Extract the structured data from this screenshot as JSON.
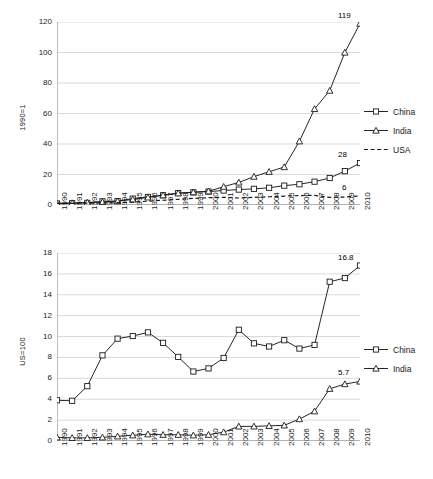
{
  "chart_data": [
    {
      "id": "top",
      "type": "line",
      "title": "",
      "xlabel": "",
      "ylabel": "1990=1",
      "ylim": [
        0,
        120
      ],
      "yticks": [
        0,
        20,
        40,
        60,
        80,
        100,
        120
      ],
      "grid": true,
      "legend_position": "right",
      "x": [
        1990,
        1991,
        1992,
        1993,
        1994,
        1995,
        1996,
        1997,
        1998,
        1999,
        2000,
        2001,
        2002,
        2003,
        2004,
        2005,
        2006,
        2007,
        2008,
        2009,
        2010
      ],
      "categories": [
        "1990",
        "1991",
        "1992",
        "1993",
        "1994",
        "1995",
        "1996",
        "1997",
        "1998",
        "1999",
        "2000",
        "2001",
        "2002",
        "2003",
        "2004",
        "2005",
        "2006",
        "2007",
        "2008",
        "2009",
        "2010"
      ],
      "series": [
        {
          "name": "China",
          "marker": "square",
          "line": "solid",
          "values": [
            1,
            1.2,
            1.4,
            2.4,
            2.6,
            4.2,
            5.3,
            6.4,
            7.8,
            8.3,
            8.8,
            9.5,
            10.1,
            10.6,
            11.3,
            12.7,
            13.6,
            15.3,
            17.7,
            22.2,
            27.5
          ],
          "end_label": "28"
        },
        {
          "name": "India",
          "marker": "triangle",
          "line": "solid",
          "values": [
            1,
            1.3,
            1.6,
            2.0,
            2.5,
            3.6,
            5.0,
            6.4,
            7.7,
            8.4,
            9.0,
            12.0,
            14.8,
            18.6,
            21.8,
            24.9,
            41.8,
            63.0,
            75.0,
            100.0,
            119.0
          ],
          "end_label": "119"
        },
        {
          "name": "USA",
          "marker": "none",
          "line": "dashed",
          "values": [
            1,
            1.1,
            1.2,
            1.3,
            1.5,
            1.9,
            2.5,
            3.1,
            3.7,
            4.3,
            4.8,
            5.0,
            4.6,
            5.0,
            5.4,
            5.8,
            6.2,
            6.3,
            5.0,
            5.2,
            6.0
          ],
          "end_label": "6"
        }
      ]
    },
    {
      "id": "bottom",
      "type": "line",
      "title": "",
      "xlabel": "",
      "ylabel": "US=100",
      "ylim": [
        0,
        18
      ],
      "yticks": [
        0,
        2,
        4,
        6,
        8,
        10,
        12,
        14,
        16,
        18
      ],
      "grid": true,
      "legend_position": "right",
      "x": [
        1990,
        1991,
        1992,
        1993,
        1994,
        1995,
        1996,
        1997,
        1998,
        1999,
        2000,
        2001,
        2002,
        2003,
        2004,
        2005,
        2006,
        2007,
        2008,
        2009,
        2010
      ],
      "categories": [
        "1990",
        "1991",
        "1992",
        "1993",
        "1994",
        "1995",
        "1996",
        "1997",
        "1998",
        "1999",
        "2000",
        "2001",
        "2002",
        "2003",
        "2004",
        "2005",
        "2006",
        "2007",
        "2008",
        "2009",
        "2010"
      ],
      "series": [
        {
          "name": "China",
          "marker": "square",
          "line": "solid",
          "values": [
            3.9,
            3.85,
            5.25,
            8.2,
            9.8,
            10.05,
            10.4,
            9.4,
            8.05,
            6.65,
            6.95,
            7.95,
            10.65,
            9.35,
            9.05,
            9.65,
            8.85,
            9.2,
            15.25,
            15.6,
            16.8
          ],
          "end_label": "16.8"
        },
        {
          "name": "India",
          "marker": "triangle",
          "line": "solid",
          "values": [
            0.35,
            0.3,
            0.3,
            0.35,
            0.45,
            0.55,
            0.65,
            0.6,
            0.6,
            0.55,
            0.6,
            0.85,
            1.4,
            1.4,
            1.45,
            1.5,
            2.1,
            2.85,
            5.0,
            5.45,
            5.7
          ],
          "end_label": "5.7"
        }
      ]
    }
  ],
  "charts": {
    "top": {
      "ylabel": "1990=1",
      "yticks": [
        "0",
        "20",
        "40",
        "60",
        "80",
        "100",
        "120"
      ],
      "xticks": [
        "1990",
        "1991",
        "1992",
        "1993",
        "1994",
        "1995",
        "1996",
        "1997",
        "1998",
        "1999",
        "2000",
        "2001",
        "2002",
        "2003",
        "2004",
        "2005",
        "2006",
        "2007",
        "2008",
        "2009",
        "2010"
      ],
      "legend": [
        "China",
        "India",
        "USA"
      ],
      "annotations": [
        "119",
        "28",
        "6"
      ]
    },
    "bottom": {
      "ylabel": "US=100",
      "yticks": [
        "0",
        "2",
        "4",
        "6",
        "8",
        "10",
        "12",
        "14",
        "16",
        "18"
      ],
      "xticks": [
        "1990",
        "1991",
        "1992",
        "1993",
        "1994",
        "1995",
        "1996",
        "1997",
        "1998",
        "1999",
        "2000",
        "2001",
        "2002",
        "2003",
        "2004",
        "2005",
        "2006",
        "2007",
        "2008",
        "2009",
        "2010"
      ],
      "legend": [
        "China",
        "India"
      ],
      "annotations": [
        "16.8",
        "5.7"
      ]
    }
  }
}
